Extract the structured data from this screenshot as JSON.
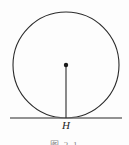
{
  "figure": {
    "tangent_point_label": "H",
    "caption": "图 2-1",
    "colors": {
      "circle_stroke": "#2b2b2b",
      "radius_stroke": "#2b2b2b",
      "center_dot": "#1a1a1a",
      "tangent_line": "#6e6e6e",
      "caption_text": "#8a8a8a",
      "background": "#fdfdfd"
    },
    "geometry": {
      "circle_center_x": 66,
      "circle_center_y": 65,
      "circle_radius": 53,
      "tangent_line_y": 118,
      "tangent_line_x1": 10,
      "tangent_line_x2": 122
    }
  }
}
